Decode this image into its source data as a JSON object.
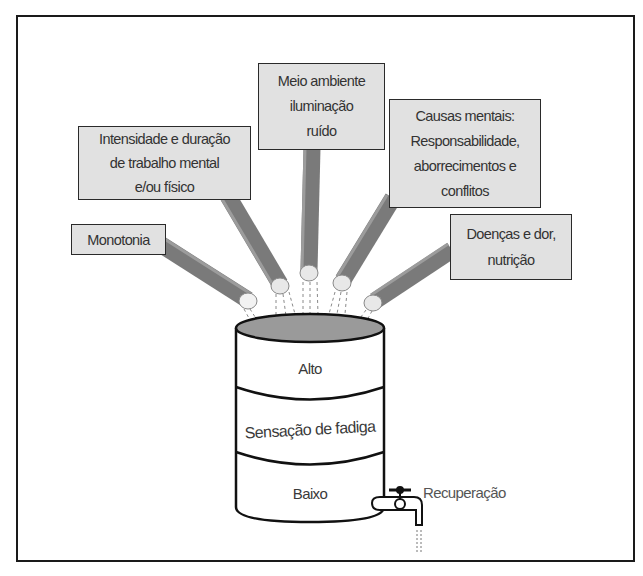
{
  "diagram": {
    "causes": [
      {
        "id": "monotonia",
        "lines": [
          "Monotonia"
        ]
      },
      {
        "id": "intensidade",
        "lines": [
          "Intensidade e duração",
          "de trabalho mental",
          "e/ou físico"
        ]
      },
      {
        "id": "meio-ambiente",
        "lines": [
          "Meio ambiente",
          "iluminação",
          "ruído"
        ]
      },
      {
        "id": "causas-mentais",
        "lines": [
          "Causas mentais:",
          "Responsabilidade,",
          "aborrecimentos e",
          "conflitos"
        ]
      },
      {
        "id": "doencas",
        "lines": [
          "Doenças e dor,",
          "nutrição"
        ]
      }
    ],
    "barrel": {
      "levels": {
        "top": "Alto",
        "middle": "Sensação de fadiga",
        "bottom": "Baixo"
      }
    },
    "outlet": {
      "label": "Recuperação"
    },
    "colors": {
      "box_fill": "#e1e1e1",
      "box_border": "#2a2a2a",
      "pipe": "#7a7a7a",
      "liquid": "#9a9a9a",
      "frame": "#1a1a1a"
    }
  }
}
